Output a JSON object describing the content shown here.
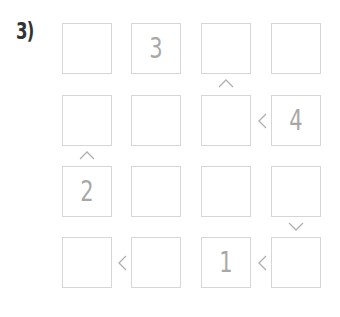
{
  "puzzle": {
    "label": "3)",
    "rows": 4,
    "cols": 4,
    "cells": [
      [
        "",
        "3",
        "",
        ""
      ],
      [
        "",
        "",
        "",
        "4"
      ],
      [
        "2",
        "",
        "",
        ""
      ],
      [
        "",
        "",
        "1",
        ""
      ]
    ],
    "constraints": [
      {
        "between": "r1c3-r2c3",
        "symbol": "^"
      },
      {
        "between": "r2c3-r2c4",
        "symbol": "<"
      },
      {
        "between": "r2c1-r3c1",
        "symbol": "^"
      },
      {
        "between": "r3c4-r4c4",
        "symbol": "v"
      },
      {
        "between": "r4c1-r4c2",
        "symbol": "<"
      },
      {
        "between": "r4c3-r4c4",
        "symbol": "<"
      }
    ]
  }
}
